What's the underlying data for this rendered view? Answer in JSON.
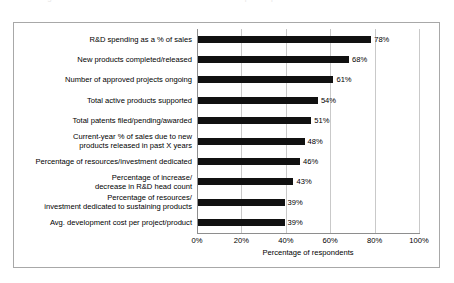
{
  "top_caption": {
    "text": "Figure: metrics used to measure research and development performance"
  },
  "chart_data": {
    "type": "bar",
    "orientation": "horizontal",
    "title": "",
    "subtitle": "",
    "xlabel": "Percentage of respondents",
    "ylabel": "",
    "xlim": [
      0,
      100
    ],
    "xticks": [
      0,
      20,
      40,
      60,
      80,
      100
    ],
    "xtick_labels": [
      "0%",
      "20%",
      "40%",
      "60%",
      "80%",
      "100%"
    ],
    "grid": "vertical",
    "legend": null,
    "bar_color": "#111111",
    "categories": [
      "R&D spending as a % of sales",
      "New products completed/released",
      "Number of approved projects ongoing",
      "Total active products supported",
      "Total patents filed/pending/awarded",
      "Current-year % of sales due to new\nproducts  released in past X years",
      "Percentage of resources/investment dedicated",
      "Percentage of increase/\ndecrease in R&D head count",
      "Percentage of resources/\ninvestment dedicated to sustaining products",
      "Avg. development cost per project/product"
    ],
    "values": [
      78,
      68,
      61,
      54,
      51,
      48,
      46,
      43,
      39,
      39
    ],
    "value_labels": [
      "78%",
      "68%",
      "61%",
      "54%",
      "51%",
      "48%",
      "46%",
      "43%",
      "39%",
      "39%"
    ]
  }
}
